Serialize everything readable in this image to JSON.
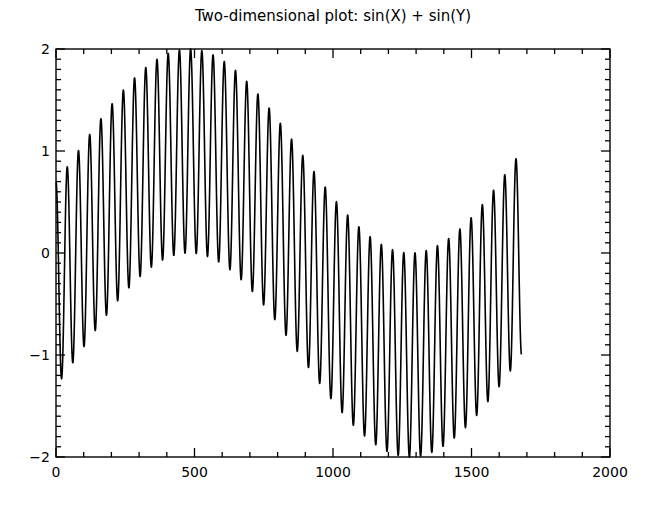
{
  "chart_data": {
    "type": "line",
    "title": "Two-dimensional plot:  sin(X) + sin(Y)",
    "xlabel": "",
    "ylabel": "",
    "xlim": [
      0,
      2000
    ],
    "ylim": [
      -2,
      2
    ],
    "x_ticks": [
      0,
      500,
      1000,
      1500,
      2000
    ],
    "x_tick_labels": [
      "0",
      "500",
      "1000",
      "1500",
      "2000"
    ],
    "x_minor_step": 100,
    "y_ticks": [
      -2,
      -1,
      0,
      1,
      2
    ],
    "y_tick_labels": [
      "-2",
      "-1",
      "0",
      "1",
      "2"
    ],
    "y_minor_step": 0.1,
    "grid": false,
    "legend": null,
    "series": [
      {
        "name": "sin(X) + sin(Y)",
        "color": "#000000",
        "x_range": [
          0,
          1680
        ],
        "fast_component": {
          "amplitude": 1,
          "period": 40.5,
          "phase_peak_at_x": 0
        },
        "slow_component": {
          "amplitude": 1,
          "period": 1600,
          "peak_at_x": 480
        },
        "midline_samples": {
          "x": [
            0,
            100,
            200,
            300,
            400,
            500,
            600,
            700,
            800,
            900,
            1000,
            1100,
            1200,
            1300,
            1400,
            1500,
            1600,
            1680
          ],
          "y": [
            -0.31,
            0.08,
            0.45,
            0.76,
            0.95,
            1.0,
            0.89,
            0.65,
            0.31,
            -0.08,
            -0.45,
            -0.76,
            -0.95,
            -1.0,
            -0.89,
            -0.65,
            -0.31,
            0.0
          ]
        },
        "observed": {
          "start_value": 0.85,
          "end_value": -0.3,
          "max_value": 2.0,
          "max_near_x": 480,
          "min_value": -2.0,
          "min_near_x": 1280
        }
      }
    ]
  },
  "plot": {
    "title": "Two-dimensional plot:  sin(X) + sin(Y)"
  }
}
